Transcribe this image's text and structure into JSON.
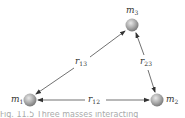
{
  "diagram": {
    "masses": [
      {
        "id": "m1",
        "name": "m",
        "sub": "1"
      },
      {
        "id": "m2",
        "name": "m",
        "sub": "2"
      },
      {
        "id": "m3",
        "name": "m",
        "sub": "3"
      }
    ],
    "distances": [
      {
        "id": "r12",
        "name": "r",
        "sub": "12"
      },
      {
        "id": "r13",
        "name": "r",
        "sub": "13"
      },
      {
        "id": "r23",
        "name": "r",
        "sub": "23"
      }
    ],
    "caption": "Fig. 11.5  Three masses interacting"
  },
  "colors": {
    "sphere": "#9a9a9a",
    "line": "#333333",
    "text": "#333333"
  }
}
